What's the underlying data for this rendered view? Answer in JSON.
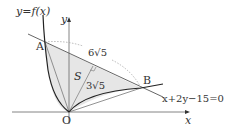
{
  "labels": {
    "curve": "y=f(x)",
    "y_axis": "y",
    "x_axis": "x",
    "origin": "O",
    "point_a": "A",
    "point_b": "B",
    "segment_ab": "6√5",
    "distance": "3√5",
    "region": "S",
    "line_eq": "x+2y−15=0"
  },
  "colors": {
    "shade": "#e6e6e6",
    "stroke": "#333333",
    "dotted": "#999999"
  }
}
